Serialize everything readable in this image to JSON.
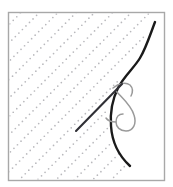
{
  "figure": {
    "type": "line-illustration",
    "width": 173,
    "height": 187,
    "background_color": "#ffffff"
  },
  "frame": {
    "name": "figure-border",
    "x": 8.5,
    "y": 12.5,
    "width": 156,
    "height": 168,
    "stroke_color": "#a8a8a8",
    "stroke_width": 1.4,
    "fill_color": "#ffffff"
  },
  "hatching": {
    "name": "tissue-hatch-pattern",
    "description": "dotted diagonal hatch lines running lower-left to upper-right",
    "dot_color": "#b9b9bd",
    "dot_radius": 0.85,
    "dot_spacing": 5.0,
    "line_spacing": 13.0,
    "angle_degrees": -45,
    "line_count": 13
  },
  "tissue_curve": {
    "name": "tissue-edge-curve",
    "stroke_color": "#1a1a1a",
    "stroke_width": 2.4,
    "path": "M 155 22 C 150 35 146 48 140 58 C 134 68 124 76 118 88 C 112 100 110 112 111 126 C 112 141 118 155 130 166"
  },
  "needle": {
    "name": "suture-needle",
    "stroke_color": "#303036",
    "stroke_width": 2.1,
    "tip_x": 122,
    "tip_y": 84,
    "tail_x": 76,
    "tail_y": 131,
    "path": "M 76 131 L 122 84"
  },
  "thread": {
    "name": "suture-thread-loop",
    "stroke_color": "#9a9a9a",
    "stroke_width": 1.5,
    "segments": [
      {
        "name": "thread-upper-arc",
        "path": "M 113 88 C 119 83 126 82 130 85 C 133 88 133 92 131 96"
      },
      {
        "name": "thread-main-loop",
        "path": "M 116 91 C 122 98 131 105 134 115 C 137 124 133 131 126 131 C 120 131 116 127 116 122 C 116 117 119 114 123 114"
      },
      {
        "name": "thread-tail",
        "path": "M 116 122 C 112 122 108 121 106 118"
      }
    ]
  },
  "accent_colors": {
    "ink": "#1a1a1a",
    "needle": "#303036",
    "thread": "#9a9a9a",
    "hatch": "#b9b9bd",
    "border": "#a8a8a8"
  }
}
